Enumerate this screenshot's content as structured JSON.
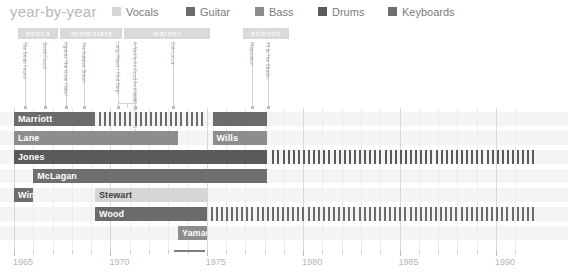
{
  "header": {
    "title": "year-by-year",
    "legend": [
      {
        "label": "Vocals",
        "color": "#d6d6d6",
        "x": 112
      },
      {
        "label": "Guitar",
        "color": "#6b6b6b",
        "x": 186
      },
      {
        "label": "Bass",
        "color": "#8d8d8d",
        "x": 255
      },
      {
        "label": "Drums",
        "color": "#5a5a5a",
        "x": 318
      },
      {
        "label": "Keyboards",
        "color": "#6e6e6e",
        "x": 388
      }
    ]
  },
  "labels": {
    "bars": [
      {
        "name": "decca",
        "x": 18,
        "w": 40
      },
      {
        "name": "immediate",
        "x": 60,
        "w": 62
      },
      {
        "name": "warner",
        "x": 124,
        "w": 86
      },
      {
        "name": "atlantic",
        "x": 243,
        "w": 46
      }
    ]
  },
  "albums": [
    {
      "title": "The Small Faces¹",
      "x": 25
    },
    {
      "title": "Small Faces²",
      "x": 45
    },
    {
      "title": "Ogdens' Nut Gone Flake³",
      "x": 66
    },
    {
      "title": "The Autumn Stone⁴",
      "x": 84
    },
    {
      "title": "Long Player / First Step⁵",
      "x": 118
    },
    {
      "title": "A Nod Is As Good As A Wink...To A Blind Horse⁶",
      "x": 135
    },
    {
      "title": "Ooh La La⁷",
      "x": 173
    },
    {
      "title": "Playmates⁸",
      "x": 252
    },
    {
      "title": "78 In The Shade⁹",
      "x": 268
    }
  ],
  "chart_data": {
    "type": "bar",
    "title": "year-by-year",
    "xlabel": "",
    "ylabel": "",
    "xlim": [
      1965,
      1992
    ],
    "grid": true,
    "legend_position": "top",
    "axis_ticks": [
      1965,
      1966,
      1967,
      1968,
      1969,
      1970,
      1971,
      1972,
      1973,
      1974,
      1975,
      1976,
      1977,
      1978,
      1979,
      1980,
      1981,
      1982,
      1983,
      1984,
      1985,
      1986,
      1987,
      1988,
      1989,
      1990,
      1991
    ],
    "axis_labels": [
      "1965",
      "1970",
      "1975",
      "1980",
      "1985",
      "1990"
    ],
    "axis_label_years": [
      1965,
      1970,
      1975,
      1980,
      1985,
      1990
    ],
    "axis_highlight": {
      "from": 1973.3,
      "to": 1974.9
    },
    "categories": [
      "Marriott",
      "Lane",
      "Jones",
      "McLagan",
      "Winston",
      "Stewart",
      "Wood",
      "Yamauchi",
      "Wills"
    ],
    "series": [
      {
        "name": "Marriott",
        "role": "Vocals / Guitar",
        "color": "#6b6b6b",
        "row": 0,
        "segments": [
          {
            "from": 1965.0,
            "to": 1969.2,
            "style": "solid"
          },
          {
            "from": 1969.4,
            "to": 1975.0,
            "style": "dashed"
          },
          {
            "from": 1975.3,
            "to": 1978.1,
            "style": "solid"
          }
        ]
      },
      {
        "name": "Lane",
        "role": "Bass",
        "color": "#8d8d8d",
        "row": 1,
        "segments": [
          {
            "from": 1965.0,
            "to": 1973.5,
            "style": "solid"
          }
        ]
      },
      {
        "name": "Wills",
        "role": "Bass",
        "color": "#8d8d8d",
        "row": 1,
        "segments": [
          {
            "from": 1975.3,
            "to": 1978.1,
            "style": "solid"
          }
        ]
      },
      {
        "name": "Jones",
        "role": "Drums",
        "color": "#5a5a5a",
        "row": 2,
        "segments": [
          {
            "from": 1965.0,
            "to": 1978.1,
            "style": "solid"
          },
          {
            "from": 1978.4,
            "to": 1992.0,
            "style": "dashed"
          }
        ]
      },
      {
        "name": "McLagan",
        "role": "Keyboards",
        "color": "#6e6e6e",
        "row": 3,
        "segments": [
          {
            "from": 1966.0,
            "to": 1978.1,
            "style": "solid"
          }
        ]
      },
      {
        "name": "Winston",
        "role": "Keyboards",
        "color": "#6e6e6e",
        "row": 4,
        "segments": [
          {
            "from": 1965.0,
            "to": 1966.0,
            "style": "solid"
          }
        ]
      },
      {
        "name": "Stewart",
        "role": "Vocals",
        "color": "#d6d6d6",
        "row": 4,
        "segments": [
          {
            "from": 1969.2,
            "to": 1975.0,
            "style": "solid"
          }
        ]
      },
      {
        "name": "Wood",
        "role": "Guitar",
        "color": "#6b6b6b",
        "row": 5,
        "segments": [
          {
            "from": 1969.2,
            "to": 1975.0,
            "style": "solid"
          },
          {
            "from": 1975.2,
            "to": 1992.0,
            "style": "dashed"
          }
        ]
      },
      {
        "name": "Yamauchi",
        "role": "Bass",
        "color": "#8d8d8d",
        "row": 6,
        "segments": [
          {
            "from": 1973.5,
            "to": 1975.0,
            "style": "solid"
          }
        ]
      }
    ]
  }
}
